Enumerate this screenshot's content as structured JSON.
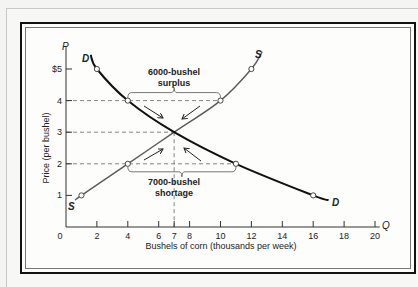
{
  "chart_data": {
    "type": "line",
    "title": "",
    "xlabel": "Bushels of corn (thousands per week)",
    "ylabel": "Price (per bushel)",
    "x_axis_symbol": "Q",
    "y_axis_symbol": "P",
    "x_ticks": [
      "0",
      "2",
      "4",
      "6",
      "7",
      "8",
      "10",
      "12",
      "14",
      "16",
      "18",
      "20"
    ],
    "y_ticks": [
      "1",
      "2",
      "3",
      "4",
      "$5"
    ],
    "xlim": [
      0,
      20
    ],
    "ylim": [
      0,
      5.5
    ],
    "grid": false,
    "series": [
      {
        "name": "S",
        "label": "Supply",
        "points": [
          [
            1,
            1
          ],
          [
            4,
            2
          ],
          [
            7,
            3
          ],
          [
            10,
            4
          ],
          [
            12,
            5
          ]
        ],
        "color": "#555555"
      },
      {
        "name": "D",
        "label": "Demand",
        "points": [
          [
            2,
            5
          ],
          [
            4,
            4
          ],
          [
            7,
            3
          ],
          [
            11,
            2
          ],
          [
            16,
            1
          ]
        ],
        "color": "#111111"
      }
    ],
    "equilibrium": {
      "q": 7,
      "p": 3
    },
    "annotations": [
      {
        "text_line1": "6000-bushel",
        "text_line2": "surplus",
        "at_price": 4,
        "from_q": 4,
        "to_q": 10
      },
      {
        "text_line1": "7000-bushel",
        "text_line2": "shortage",
        "at_price": 2,
        "from_q": 4,
        "to_q": 11
      }
    ]
  }
}
